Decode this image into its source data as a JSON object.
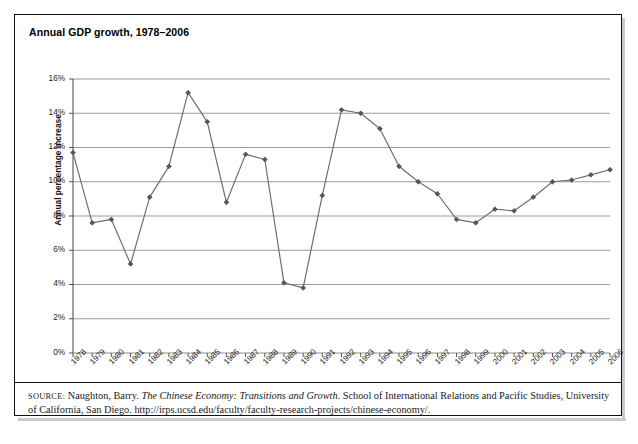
{
  "figure": {
    "title": "Annual GDP growth, 1978–2006",
    "source_label": "SOURCE:",
    "source_text_part1": " Naughton, Barry. ",
    "source_italic": "The Chinese Economy: Transitions and Growth",
    "source_text_part2": ". School of International Relations and Pacific Studies, University of California, San Diego. http://irps.ucsd.edu/faculty/faculty-research-projects/chinese-economy/.",
    "line_color": "#6e6e6e",
    "marker_color": "#555555",
    "grid_color": "#8f8f8f",
    "axis_color": "#555555",
    "border_color": "#111111"
  },
  "chart_data": {
    "type": "line",
    "title": "Annual GDP growth, 1978–2006",
    "xlabel": "",
    "ylabel": "Annual percentage increase",
    "ylim": [
      0,
      16
    ],
    "ytick_step": 2,
    "ytick_labels": [
      "0%",
      "2%",
      "4%",
      "6%",
      "8%",
      "10%",
      "12%",
      "14%",
      "16%"
    ],
    "ytick_values": [
      0,
      2,
      4,
      6,
      8,
      10,
      12,
      14,
      16
    ],
    "grid": "horizontal",
    "legend": "none",
    "categories": [
      "1978",
      "1979",
      "1980",
      "1981",
      "1982",
      "1983",
      "1984",
      "1985",
      "1986",
      "1987",
      "1988",
      "1989",
      "1990",
      "1991",
      "1992",
      "1993",
      "1994",
      "1995",
      "1996",
      "1997",
      "1998",
      "1999",
      "2000",
      "2001",
      "2002",
      "2003",
      "2004",
      "2005",
      "2006"
    ],
    "values": [
      11.7,
      7.6,
      7.8,
      5.2,
      9.1,
      10.9,
      15.2,
      13.5,
      8.8,
      11.6,
      11.3,
      4.1,
      3.8,
      9.2,
      14.2,
      14.0,
      13.1,
      10.9,
      10.0,
      9.3,
      7.8,
      7.6,
      8.4,
      8.3,
      9.1,
      10.0,
      10.1,
      10.4,
      10.7
    ],
    "series_name": "Annual percentage increase"
  }
}
